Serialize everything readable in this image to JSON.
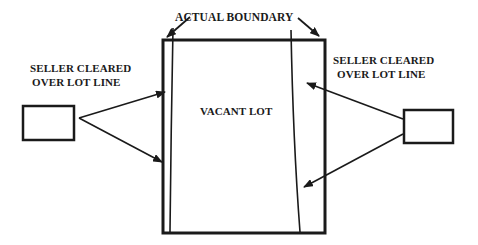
{
  "diagram": {
    "title_label": "ACTUAL BOUNDARY",
    "center_label": "VACANT LOT",
    "left_annotation": {
      "line1": "SELLER CLEARED",
      "line2": "OVER LOT LINE"
    },
    "right_annotation": {
      "line1": "SELLER CLEARED",
      "line2": "OVER LOT LINE"
    },
    "colors": {
      "stroke": "#1a1a1a",
      "background": "#ffffff"
    }
  }
}
